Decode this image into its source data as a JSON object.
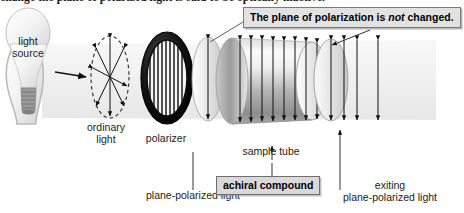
{
  "figure": {
    "heading_clipped": "change the plane of polarized light is said to be optically inactive.",
    "callout": {
      "text_before": "The plane of polarization is ",
      "emphasis": "not",
      "text_after": " changed."
    },
    "labels": {
      "light_source_line1": "light",
      "light_source_line2": "source",
      "ordinary_light_line1": "ordinary",
      "ordinary_light_line2": "light",
      "polarizer": "polarizer",
      "sample_tube": "sample tube",
      "plane_polarized_light": "plane-polarized light",
      "achiral_compound": "achiral compound",
      "exiting_line1": "exiting",
      "exiting_line2": "plane-polarized light"
    },
    "colors": {
      "callout_fill": "#e2e2e2",
      "callout_border": "#7a7a7a",
      "box_fill": "#d9d9d9",
      "box_border": "#6f6f6f",
      "polarizer_ring": "#101010",
      "tube_light": "#f2f2f2",
      "tube_dark": "#8f8f8f",
      "beam_band": "#efefef",
      "text": "#1c1c1c",
      "arrow": "#111111"
    },
    "icons": {
      "light_bulb": "light-bulb-icon",
      "unpolarized_wave": "radiating-arrows-icon",
      "polarizer_grating": "vertical-slits-icon",
      "polarized_wave": "vertical-double-arrow-icon"
    },
    "counts": {
      "unpolarized_arrows": 4,
      "tube_arrows": 8,
      "exiting_arrows": 2
    }
  }
}
